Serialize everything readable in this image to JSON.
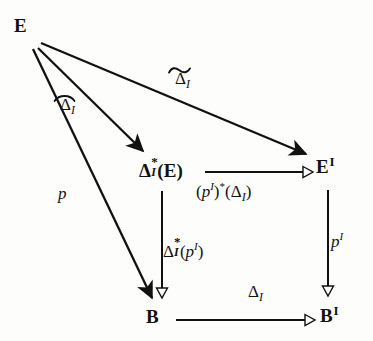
{
  "diagram": {
    "kind": "commutative-diagram",
    "ink_color": "#111111",
    "background_color": "#fdfdfc"
  },
  "nodes": {
    "e": {
      "name": "E",
      "base": "E"
    },
    "delta_star_e": {
      "name": "Delta*_I(E)",
      "base": "Δ",
      "star": "*",
      "sub": "I",
      "tail": "(E)"
    },
    "e_i": {
      "name": "E^I",
      "base": "E",
      "sup": "I"
    },
    "b": {
      "name": "B",
      "base": "B"
    },
    "b_i": {
      "name": "B^I",
      "base": "B",
      "sup": "I"
    }
  },
  "arrow_labels": {
    "hat_delta_i": {
      "base": "Δ",
      "sub": "I",
      "accent": "hat",
      "text": "Δ̂_I"
    },
    "tilde_delta_i": {
      "base": "Δ",
      "sub": "I",
      "accent": "tilde",
      "text": "Δ̃_I"
    },
    "p": {
      "text": "p"
    },
    "pullback_delta": {
      "text": "(p^I)*(Δ_I)",
      "open": "(",
      "p": "p",
      "sup": "I",
      "mid": ")",
      "star": "*",
      "open2": "(",
      "delta": "Δ",
      "sub": "I",
      "close": ")"
    },
    "delta_star_p_i": {
      "text": "Δ*_I(p^I)",
      "base": "Δ",
      "star": "*",
      "sub": "I",
      "open": "(",
      "p": "p",
      "sup": "I",
      "close": ")"
    },
    "p_i": {
      "text": "p^I",
      "p": "p",
      "sup": "I"
    },
    "delta_i": {
      "base": "Δ",
      "sub": "I",
      "text": "Δ_I"
    }
  },
  "arrows": [
    {
      "name": "arrow-e-to-ei",
      "from": "E",
      "to": "E^I",
      "label": "Δ̃_I",
      "head": "solid"
    },
    {
      "name": "arrow-e-to-delta-star-e",
      "from": "E",
      "to": "Δ*_I(E)",
      "label": "Δ̂_I",
      "head": "solid"
    },
    {
      "name": "arrow-e-to-b",
      "from": "E",
      "to": "B",
      "label": "p",
      "head": "solid"
    },
    {
      "name": "arrow-delta-star-e-to-ei",
      "from": "Δ*_I(E)",
      "to": "E^I",
      "label": "(p^I)*(Δ_I)",
      "head": "hollow"
    },
    {
      "name": "arrow-delta-star-e-to-b",
      "from": "Δ*_I(E)",
      "to": "B",
      "label": "Δ*_I(p^I)",
      "head": "hollow"
    },
    {
      "name": "arrow-ei-to-bi",
      "from": "E^I",
      "to": "B^I",
      "label": "p^I",
      "head": "hollow"
    },
    {
      "name": "arrow-b-to-bi",
      "from": "B",
      "to": "B^I",
      "label": "Δ_I",
      "head": "hollow"
    }
  ]
}
